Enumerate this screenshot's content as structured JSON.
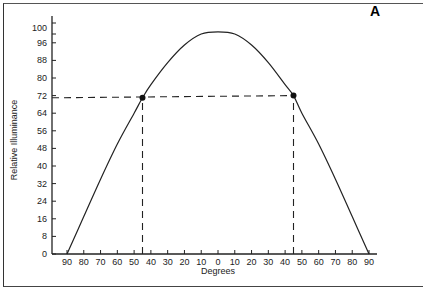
{
  "panel_label": "A",
  "chart_data": {
    "type": "line",
    "title": "",
    "xlabel": "Degrees",
    "ylabel": "Relative Illuminance",
    "x_tick_labels": [
      "90",
      "80",
      "70",
      "60",
      "50",
      "40",
      "30",
      "20",
      "10",
      "0",
      "10",
      "20",
      "30",
      "40",
      "50",
      "60",
      "70",
      "80",
      "90"
    ],
    "x": [
      -90,
      -80,
      -70,
      -60,
      -50,
      -40,
      -30,
      -20,
      -10,
      0,
      10,
      20,
      30,
      40,
      50,
      60,
      70,
      80,
      90
    ],
    "y_ticks": [
      0,
      8,
      16,
      24,
      32,
      40,
      48,
      56,
      64,
      72,
      80,
      88,
      96,
      100
    ],
    "xlim": [
      -90,
      90
    ],
    "ylim": [
      0,
      106
    ],
    "grid": false,
    "legend": null,
    "series": [
      {
        "name": "Relative Illuminance",
        "x": [
          -90,
          -80,
          -70,
          -60,
          -50,
          -45,
          -40,
          -30,
          -20,
          -10,
          0,
          10,
          20,
          30,
          40,
          45,
          50,
          60,
          70,
          80,
          90
        ],
        "values": [
          0,
          17,
          34,
          50,
          64,
          71,
          77,
          87,
          95,
          100,
          101,
          100,
          95,
          87,
          77,
          72,
          64,
          50,
          34,
          17,
          0
        ]
      }
    ],
    "annotations": [
      {
        "type": "point",
        "x": -45,
        "y": 71
      },
      {
        "type": "point",
        "x": 45,
        "y": 72
      },
      {
        "type": "dashed-line",
        "from": [
          -90,
          71
        ],
        "to": [
          45,
          72
        ]
      },
      {
        "type": "dashed-line",
        "from": [
          -45,
          0
        ],
        "to": [
          -45,
          71
        ]
      },
      {
        "type": "dashed-line",
        "from": [
          45,
          0
        ],
        "to": [
          45,
          72
        ]
      }
    ]
  }
}
